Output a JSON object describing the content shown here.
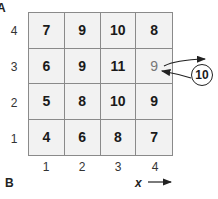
{
  "labels": {
    "panel_top": "A",
    "panel_bottom": "B",
    "x_axis": "x"
  },
  "grid": {
    "rows": [
      {
        "y": "4",
        "values": [
          "7",
          "9",
          "10",
          "8"
        ]
      },
      {
        "y": "3",
        "values": [
          "6",
          "9",
          "11",
          "9"
        ]
      },
      {
        "y": "2",
        "values": [
          "5",
          "8",
          "10",
          "9"
        ]
      },
      {
        "y": "1",
        "values": [
          "4",
          "6",
          "8",
          "7"
        ]
      }
    ],
    "x_ticks": [
      "1",
      "2",
      "3",
      "4"
    ],
    "y_ticks": [
      "4",
      "3",
      "2",
      "1"
    ]
  },
  "annotation": {
    "highlight_cell": {
      "x": "4",
      "y": "3",
      "value": "9"
    },
    "replacement_value": "10"
  },
  "colors": {
    "cell_bg": "#f2f2f2",
    "grid_line": "#8a8a8a",
    "text": "#1a1a1a",
    "dim_text": "#777777"
  }
}
